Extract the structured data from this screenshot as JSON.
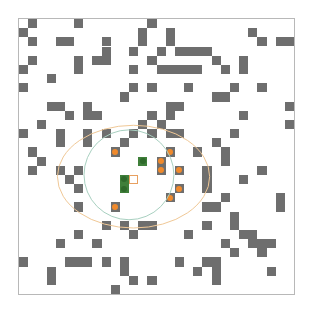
{
  "grid": {
    "cols": 30,
    "rows": 30,
    "cell_size_px": 9.17,
    "colors": {
      "background": "#ffffff",
      "border": "#b8b8b8",
      "obstacle": "#6e6e6e",
      "visited_dot": "#f08a2c",
      "frontier": "#3f7f3a",
      "agent_border": "#e8a060",
      "outer_ellipse": "#f0c896",
      "inner_circle": "#a8d0c0"
    },
    "obstacles": [
      [
        0,
        1
      ],
      [
        0,
        6
      ],
      [
        0,
        14
      ],
      [
        1,
        0
      ],
      [
        1,
        13
      ],
      [
        1,
        16
      ],
      [
        1,
        25
      ],
      [
        2,
        1
      ],
      [
        2,
        4
      ],
      [
        2,
        5
      ],
      [
        2,
        9
      ],
      [
        2,
        13
      ],
      [
        2,
        16
      ],
      [
        2,
        26
      ],
      [
        2,
        28
      ],
      [
        2,
        29
      ],
      [
        3,
        9
      ],
      [
        3,
        12
      ],
      [
        3,
        15
      ],
      [
        3,
        17
      ],
      [
        3,
        18
      ],
      [
        3,
        19
      ],
      [
        3,
        20
      ],
      [
        4,
        1
      ],
      [
        4,
        6
      ],
      [
        4,
        8
      ],
      [
        4,
        9
      ],
      [
        4,
        14
      ],
      [
        4,
        21
      ],
      [
        4,
        24
      ],
      [
        5,
        0
      ],
      [
        5,
        6
      ],
      [
        5,
        12
      ],
      [
        5,
        15
      ],
      [
        5,
        16
      ],
      [
        5,
        17
      ],
      [
        5,
        18
      ],
      [
        5,
        19
      ],
      [
        5,
        22
      ],
      [
        5,
        24
      ],
      [
        6,
        3
      ],
      [
        7,
        0
      ],
      [
        7,
        12
      ],
      [
        7,
        14
      ],
      [
        7,
        18
      ],
      [
        7,
        23
      ],
      [
        7,
        26
      ],
      [
        8,
        11
      ],
      [
        8,
        21
      ],
      [
        8,
        22
      ],
      [
        9,
        3
      ],
      [
        9,
        4
      ],
      [
        9,
        7
      ],
      [
        9,
        16
      ],
      [
        9,
        17
      ],
      [
        9,
        29
      ],
      [
        10,
        5
      ],
      [
        10,
        7
      ],
      [
        10,
        8
      ],
      [
        10,
        14
      ],
      [
        10,
        16
      ],
      [
        10,
        24
      ],
      [
        11,
        2
      ],
      [
        11,
        13
      ],
      [
        11,
        15
      ],
      [
        11,
        29
      ],
      [
        12,
        0
      ],
      [
        12,
        4
      ],
      [
        12,
        7
      ],
      [
        12,
        9
      ],
      [
        12,
        12
      ],
      [
        12,
        14
      ],
      [
        12,
        16
      ],
      [
        12,
        17
      ],
      [
        12,
        23
      ],
      [
        13,
        4
      ],
      [
        13,
        7
      ],
      [
        13,
        11
      ],
      [
        13,
        21
      ],
      [
        14,
        1
      ],
      [
        14,
        19
      ],
      [
        14,
        22
      ],
      [
        15,
        2
      ],
      [
        15,
        22
      ],
      [
        16,
        1
      ],
      [
        16,
        4
      ],
      [
        16,
        6
      ],
      [
        16,
        20
      ],
      [
        16,
        26
      ],
      [
        17,
        5
      ],
      [
        17,
        20
      ],
      [
        17,
        24
      ],
      [
        18,
        6
      ],
      [
        18,
        20
      ],
      [
        19,
        16
      ],
      [
        19,
        22
      ],
      [
        19,
        28
      ],
      [
        20,
        6
      ],
      [
        20,
        20
      ],
      [
        20,
        21
      ],
      [
        20,
        28
      ],
      [
        21,
        23
      ],
      [
        22,
        9
      ],
      [
        22,
        11
      ],
      [
        22,
        13
      ],
      [
        22,
        14
      ],
      [
        22,
        20
      ],
      [
        22,
        23
      ],
      [
        23,
        6
      ],
      [
        23,
        12
      ],
      [
        23,
        18
      ],
      [
        23,
        24
      ],
      [
        23,
        25
      ],
      [
        24,
        4
      ],
      [
        24,
        8
      ],
      [
        24,
        22
      ],
      [
        24,
        25
      ],
      [
        24,
        26
      ],
      [
        24,
        27
      ],
      [
        25,
        23
      ],
      [
        25,
        26
      ],
      [
        26,
        0
      ],
      [
        26,
        5
      ],
      [
        26,
        6
      ],
      [
        26,
        7
      ],
      [
        26,
        9
      ],
      [
        26,
        11
      ],
      [
        26,
        17
      ],
      [
        26,
        20
      ],
      [
        26,
        21
      ],
      [
        27,
        3
      ],
      [
        27,
        11
      ],
      [
        27,
        19
      ],
      [
        27,
        21
      ],
      [
        27,
        27
      ],
      [
        28,
        3
      ],
      [
        28,
        12
      ],
      [
        28,
        14
      ],
      [
        28,
        21
      ],
      [
        29,
        10
      ]
    ],
    "visited": [
      [
        14,
        10
      ],
      [
        14,
        16
      ],
      [
        15,
        15
      ],
      [
        16,
        15
      ],
      [
        16,
        17
      ],
      [
        18,
        17
      ],
      [
        19,
        16
      ],
      [
        20,
        10
      ]
    ],
    "frontier": [
      [
        15,
        13
      ],
      [
        17,
        11
      ],
      [
        18,
        11
      ]
    ],
    "agent": [
      17,
      12
    ],
    "outer_ellipse": {
      "cx_cell": 12.6,
      "cy_cell": 17.3,
      "rx_cells": 8.3,
      "ry_cells": 5.6
    },
    "inner_circle": {
      "cx_cell": 12.1,
      "cy_cell": 17.1,
      "r_cells": 4.9
    }
  }
}
